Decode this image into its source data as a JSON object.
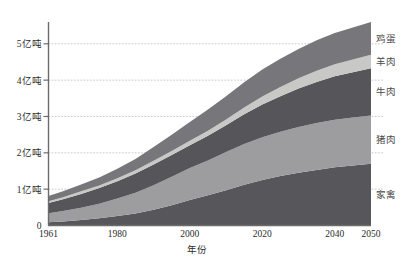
{
  "chart_data": {
    "type": "area",
    "stacked": true,
    "title": "",
    "subtitle": "",
    "xlabel": "年份",
    "ylabel": "",
    "xlim": [
      1961,
      2050
    ],
    "ylim": [
      0,
      5.6
    ],
    "grid": true,
    "legend_position": "right-outside",
    "x": [
      1961,
      1965,
      1970,
      1975,
      1980,
      1985,
      1990,
      1995,
      2000,
      2005,
      2010,
      2015,
      2020,
      2025,
      2030,
      2035,
      2040,
      2045,
      2050
    ],
    "xticks": [
      1961,
      1980,
      2000,
      2020,
      2040,
      2050
    ],
    "xtick_labels": [
      "1961",
      "1980",
      "2000",
      "2020",
      "2040",
      "2050"
    ],
    "yticks": [
      0,
      1,
      2,
      3,
      4,
      5
    ],
    "ytick_labels": [
      "0",
      "1亿吨",
      "2亿吨",
      "3亿吨",
      "4亿吨",
      "5亿吨"
    ],
    "unit_note": "亿吨",
    "series": [
      {
        "name": "家禽",
        "color": "#57575b",
        "values": [
          0.09,
          0.11,
          0.15,
          0.2,
          0.26,
          0.33,
          0.43,
          0.56,
          0.7,
          0.83,
          0.97,
          1.12,
          1.25,
          1.36,
          1.45,
          1.53,
          1.6,
          1.65,
          1.7
        ]
      },
      {
        "name": "猪肉",
        "color": "#9d9d9f",
        "values": [
          0.25,
          0.29,
          0.34,
          0.4,
          0.48,
          0.57,
          0.68,
          0.78,
          0.88,
          0.96,
          1.05,
          1.12,
          1.18,
          1.22,
          1.26,
          1.29,
          1.31,
          1.32,
          1.33
        ]
      },
      {
        "name": "牛肉",
        "color": "#55555a",
        "values": [
          0.28,
          0.32,
          0.38,
          0.43,
          0.48,
          0.53,
          0.57,
          0.6,
          0.63,
          0.68,
          0.74,
          0.82,
          0.9,
          0.98,
          1.06,
          1.13,
          1.2,
          1.25,
          1.3
        ]
      },
      {
        "name": "羊肉",
        "color": "#c8c8c6",
        "values": [
          0.05,
          0.06,
          0.07,
          0.07,
          0.08,
          0.09,
          0.1,
          0.11,
          0.12,
          0.14,
          0.16,
          0.19,
          0.22,
          0.25,
          0.28,
          0.31,
          0.33,
          0.35,
          0.37
        ]
      },
      {
        "name": "鸡蛋",
        "color": "#77777b",
        "values": [
          0.14,
          0.16,
          0.19,
          0.22,
          0.26,
          0.31,
          0.38,
          0.45,
          0.52,
          0.58,
          0.64,
          0.69,
          0.74,
          0.78,
          0.81,
          0.84,
          0.86,
          0.88,
          0.9
        ]
      }
    ],
    "legend_entries": [
      {
        "label": "鸡蛋",
        "color": "#77777b"
      },
      {
        "label": "羊肉",
        "color": "#c8c8c6"
      },
      {
        "label": "牛肉",
        "color": "#55555a"
      },
      {
        "label": "猪肉",
        "color": "#9d9d9f"
      },
      {
        "label": "家禽",
        "color": "#57575b"
      }
    ],
    "colors": {
      "background": "#ffffff",
      "axis": "#6b6b6b",
      "grid": "#b9b9b9",
      "tick_text": "#2b2b2b",
      "legend_text": "#4a4a4a"
    }
  }
}
